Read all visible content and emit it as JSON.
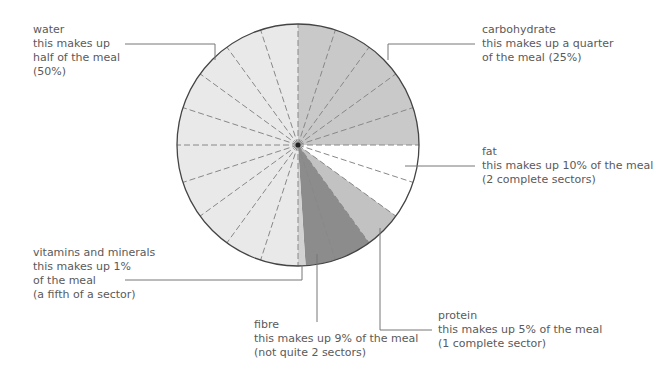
{
  "chart_data": {
    "type": "pie",
    "title": "",
    "start_angle_deg": 0,
    "direction": "clockwise",
    "sector_size_percent": 5,
    "sector_count": 20,
    "categories": [
      "carbohydrate",
      "fat",
      "protein",
      "fibre",
      "vitamins and minerals",
      "water"
    ],
    "values": [
      25,
      10,
      5,
      9,
      1,
      50
    ],
    "colors": [
      "#c9c9c9",
      "#ffffff",
      "#c2c2c2",
      "#8c8c8c",
      "#d2d2d2",
      "#e9e9e9"
    ],
    "annotations": [
      {
        "category": "water",
        "lines": [
          "water",
          "this makes up",
          "half of the meal",
          "(50%)"
        ]
      },
      {
        "category": "carbohydrate",
        "lines": [
          "carbohydrate",
          "this makes up a quarter",
          "of the meal (25%)"
        ]
      },
      {
        "category": "fat",
        "lines": [
          "fat",
          "this makes up 10% of the meal",
          "(2 complete sectors)"
        ]
      },
      {
        "category": "protein",
        "lines": [
          "protein",
          "this makes up 5% of the meal",
          "(1 complete sector)"
        ]
      },
      {
        "category": "fibre",
        "lines": [
          "fibre",
          "this makes up 9% of the meal",
          "(not quite 2 sectors)"
        ]
      },
      {
        "category": "vitamins and minerals",
        "lines": [
          "vitamins and minerals",
          "this makes up 1%",
          "of the meal",
          "(a fifth of a sector)"
        ]
      }
    ]
  },
  "labels": {
    "water": [
      "water",
      "this makes up",
      "half of the meal",
      "(50%)"
    ],
    "carbohydrate": [
      "carbohydrate",
      "this makes up a quarter",
      "of the meal (25%)"
    ],
    "fat": [
      "fat",
      "this makes up 10% of the meal",
      "(2 complete sectors)"
    ],
    "protein": [
      "protein",
      "this makes up 5% of the meal",
      "(1 complete sector)"
    ],
    "fibre": [
      "fibre",
      "this makes up 9% of the meal",
      "(not quite 2 sectors)"
    ],
    "vitamins": [
      "vitamins and minerals",
      "this makes up 1%",
      "of the meal",
      "(a fifth of a sector)"
    ]
  },
  "style": {
    "outline_color": "#444444",
    "dash_color": "#888888",
    "leader_color": "#777777"
  }
}
